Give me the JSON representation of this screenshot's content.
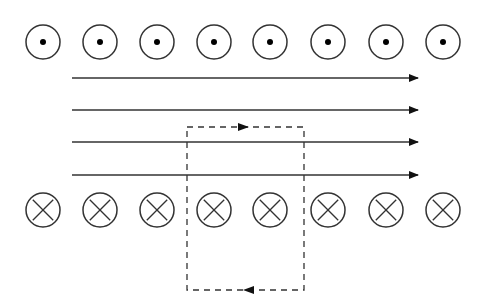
{
  "diagram": {
    "colors": {
      "background": "#ffffff",
      "stroke": "#333333",
      "dot": "#000000"
    },
    "top_row": {
      "symbol": "current-out-of-page",
      "y": 42,
      "radius": 17,
      "x_positions": [
        43,
        100,
        157,
        214,
        270,
        328,
        386,
        443
      ]
    },
    "bottom_row": {
      "symbol": "current-into-page",
      "y": 210,
      "radius": 17,
      "x_positions": [
        43,
        100,
        157,
        214,
        270,
        328,
        386,
        443
      ]
    },
    "field_lines": {
      "direction": "right",
      "x_start": 72,
      "x_end": 418,
      "y_positions": [
        78,
        110,
        142,
        175
      ]
    },
    "amperian_loop": {
      "style": "dashed",
      "x": 187,
      "y": 127,
      "width": 117,
      "height": 163,
      "top_arrow": {
        "x": 243,
        "direction": "right"
      },
      "bottom_arrow": {
        "x": 249,
        "direction": "left"
      }
    }
  }
}
